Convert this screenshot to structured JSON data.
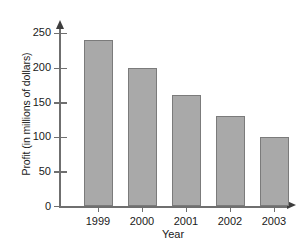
{
  "chart_data": {
    "type": "bar",
    "title": "",
    "xlabel": "Year",
    "ylabel": "Profit (in millions of dollars)",
    "categories": [
      "1999",
      "2000",
      "2001",
      "2002",
      "2003"
    ],
    "values": [
      240,
      200,
      160,
      130,
      100
    ],
    "series": [
      {
        "name": "Profit",
        "values": [
          240,
          200,
          160,
          130,
          100
        ]
      }
    ],
    "ylim": [
      0,
      260
    ],
    "yticks": [
      0,
      50,
      100,
      150,
      200,
      250
    ],
    "ytick_labels": [
      "0",
      "50",
      "100",
      "150",
      "200",
      "250"
    ],
    "grid": false,
    "legend": false,
    "legend_position": "none",
    "bar_color": "#a9a9a9",
    "bar_border_color": "#7b7b7b",
    "axis_color": "#6f6f6f",
    "text_color": "#1a1a1a",
    "background_color": "#ffffff",
    "axis_style": "arrow-tipped"
  }
}
